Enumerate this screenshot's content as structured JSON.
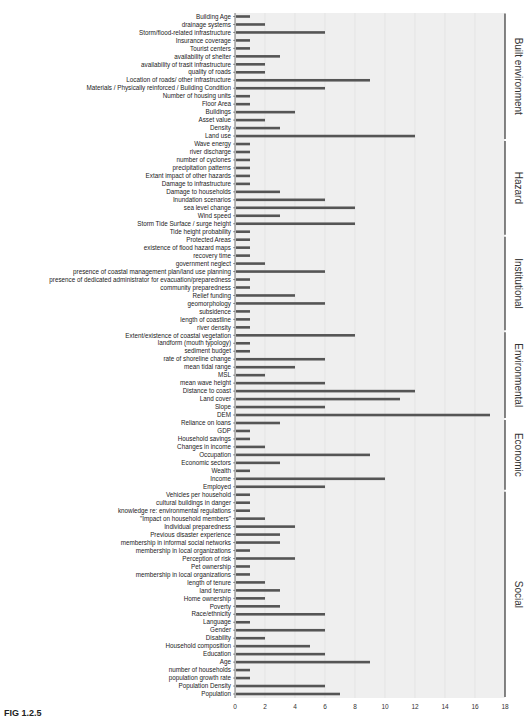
{
  "figure_caption": "FIG 1.2.5",
  "chart_data": {
    "type": "bar",
    "orientation": "horizontal",
    "title": "",
    "xlabel": "",
    "ylabel": "",
    "xlim": [
      0,
      18
    ],
    "x_ticks": [
      0,
      2,
      4,
      6,
      8,
      10,
      12,
      14,
      16,
      18
    ],
    "grid": true,
    "bar_color": "#555555",
    "background_color": "#efefef",
    "groups": [
      {
        "name": "Built environment",
        "items": [
          [
            "Building Age",
            1
          ],
          [
            "drainage systems",
            2
          ],
          [
            "Storm/flood-related infrastructure",
            6
          ],
          [
            "Insurance coverage",
            1
          ],
          [
            "Tourist centers",
            1
          ],
          [
            "availability of shelter",
            3
          ],
          [
            "availability of trasit infrastructure",
            2
          ],
          [
            "quality of roads",
            2
          ],
          [
            "Location of roads/ other infrastructure",
            9
          ],
          [
            "Materials / Physically reinforced / Building Condition",
            6
          ],
          [
            "Number of housing units",
            1
          ],
          [
            "Floor Area",
            1
          ],
          [
            "Buildings",
            4
          ],
          [
            "Asset value",
            2
          ],
          [
            "Density",
            3
          ],
          [
            "Land use",
            12
          ]
        ]
      },
      {
        "name": "Hazard",
        "items": [
          [
            "Wave energy",
            1
          ],
          [
            "river discharge",
            1
          ],
          [
            "number of cyclones",
            1
          ],
          [
            "precipitation patterns",
            1
          ],
          [
            "Extant impact of other hazards",
            1
          ],
          [
            "Damage to infrastructure",
            1
          ],
          [
            "Damage to households",
            3
          ],
          [
            "Inundation scenarios",
            6
          ],
          [
            "sea level change",
            8
          ],
          [
            "Wind speed",
            3
          ],
          [
            "Storm Tide Surface / surge height",
            8
          ],
          [
            "Tide height probability",
            1
          ]
        ]
      },
      {
        "name": "Institutional",
        "items": [
          [
            "Protected Areas",
            1
          ],
          [
            "existence of flood hazard maps",
            1
          ],
          [
            "recovery time",
            1
          ],
          [
            "government neglect",
            2
          ],
          [
            "presence of coastal management plan/land use planning",
            6
          ],
          [
            "presence of dedicated administrator for evacuation/preparedness",
            1
          ],
          [
            "community preparedness",
            1
          ],
          [
            "Relief funding",
            4
          ],
          [
            "geomorphology",
            6
          ],
          [
            "subsidence",
            1
          ],
          [
            "length of coastline",
            1
          ],
          [
            "river density",
            1
          ]
        ]
      },
      {
        "name": "Environmental",
        "items": [
          [
            "Extent/existence of coastal vegetation",
            8
          ],
          [
            "landform (mouth typology)",
            1
          ],
          [
            "sediment budget",
            1
          ],
          [
            "rate of shoreline change",
            6
          ],
          [
            "mean tidal range",
            4
          ],
          [
            "MSL",
            2
          ],
          [
            "mean wave height",
            6
          ],
          [
            "Distance to coast",
            12
          ],
          [
            "Land cover",
            11
          ],
          [
            "Slope",
            6
          ],
          [
            "DEM",
            17
          ]
        ]
      },
      {
        "name": "Economic",
        "items": [
          [
            "Reliance on loans",
            3
          ],
          [
            "GDP",
            1
          ],
          [
            "Household savings",
            1
          ],
          [
            "Changes in income",
            2
          ],
          [
            "Occupation",
            9
          ],
          [
            "Economic sectors",
            3
          ],
          [
            "Wealth",
            1
          ],
          [
            "Income",
            10
          ],
          [
            "Employed",
            6
          ]
        ]
      },
      {
        "name": "Social",
        "items": [
          [
            "Vehicles per household",
            1
          ],
          [
            "cultural buildings in danger",
            1
          ],
          [
            "knowledge re: environmental regulations",
            1
          ],
          [
            "\"Impact on household members\"",
            2
          ],
          [
            "Individual preparedness",
            4
          ],
          [
            "Previous disaster experience",
            3
          ],
          [
            "membership in informal social networks",
            3
          ],
          [
            "membership in local organizations",
            1
          ],
          [
            "Perception of risk",
            4
          ],
          [
            "Pet ownership",
            1
          ],
          [
            "membership in local organizations",
            1
          ],
          [
            "length of tenure",
            2
          ],
          [
            "land tenure",
            3
          ],
          [
            "Home ownership",
            2
          ],
          [
            "Poverty",
            3
          ],
          [
            "Race/ethnicity",
            6
          ],
          [
            "Language",
            1
          ],
          [
            "Gender",
            6
          ],
          [
            "Disability",
            2
          ],
          [
            "Household composition",
            5
          ],
          [
            "Education",
            6
          ],
          [
            "Age",
            9
          ],
          [
            "number of households",
            1
          ],
          [
            "population growth rate",
            1
          ],
          [
            "Population Density",
            6
          ],
          [
            "Population",
            7
          ]
        ]
      }
    ]
  }
}
